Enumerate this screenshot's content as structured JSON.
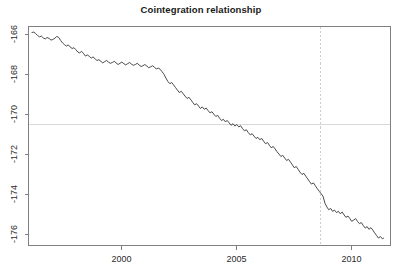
{
  "chart_data": {
    "type": "line",
    "title": "Cointegration relationship",
    "xlabel": "",
    "ylabel": "",
    "grid": false,
    "legend": null,
    "xlim": [
      1996.05,
      1996.05
    ],
    "xaxis": {
      "ticks": [
        2000,
        2005,
        2010
      ],
      "tick_labels": [
        "2000",
        "2005",
        "2010"
      ],
      "range": [
        1996.0,
        1411.4
      ]
    },
    "yaxis": {
      "ticks": [
        -166,
        -168,
        -170,
        -172,
        -174,
        -176
      ],
      "tick_labels": [
        "-166",
        "-168",
        "-170",
        "-172",
        "-174",
        "-176"
      ],
      "range": [
        -176.55,
        -165.6
      ]
    },
    "annotations": [
      {
        "name": "mean-reference-line",
        "type": "hline",
        "y": -170.5,
        "style": "solid",
        "color": "#d9d9d9"
      },
      {
        "name": "break-date-line",
        "type": "vline",
        "x": 2008.65,
        "style": "dashed",
        "color": "#cccccc"
      }
    ],
    "series": [
      {
        "name": "cointegration residual",
        "color": "#4a4a4a",
        "x": [
          1996.1,
          1996.18,
          1996.26,
          1996.35,
          1996.43,
          1996.51,
          1996.6,
          1996.68,
          1996.76,
          1996.85,
          1996.93,
          1997.01,
          1997.1,
          1997.18,
          1997.26,
          1997.35,
          1997.43,
          1997.51,
          1997.6,
          1997.68,
          1997.76,
          1997.85,
          1997.93,
          1998.01,
          1998.1,
          1998.18,
          1998.26,
          1998.35,
          1998.43,
          1998.51,
          1998.6,
          1998.68,
          1998.76,
          1998.85,
          1998.93,
          1999.01,
          1999.1,
          1999.18,
          1999.26,
          1999.35,
          1999.43,
          1999.51,
          1999.6,
          1999.68,
          1999.76,
          1999.85,
          1999.93,
          2000.01,
          2000.1,
          2000.18,
          2000.26,
          2000.35,
          2000.43,
          2000.51,
          2000.6,
          2000.68,
          2000.76,
          2000.85,
          2000.93,
          2001.01,
          2001.1,
          2001.18,
          2001.26,
          2001.35,
          2001.43,
          2001.51,
          2001.6,
          2001.68,
          2001.76,
          2001.85,
          2001.93,
          2002.01,
          2002.1,
          2002.18,
          2002.26,
          2002.35,
          2002.43,
          2002.51,
          2002.6,
          2002.68,
          2002.76,
          2002.85,
          2002.93,
          2003.01,
          2003.1,
          2003.18,
          2003.26,
          2003.35,
          2003.43,
          2003.51,
          2003.6,
          2003.68,
          2003.76,
          2003.85,
          2003.93,
          2004.01,
          2004.1,
          2004.18,
          2004.26,
          2004.35,
          2004.43,
          2004.51,
          2004.6,
          2004.68,
          2004.76,
          2004.85,
          2004.93,
          2005.01,
          2005.1,
          2005.18,
          2005.26,
          2005.35,
          2005.43,
          2005.51,
          2005.6,
          2005.68,
          2005.76,
          2005.85,
          2005.93,
          2006.01,
          2006.1,
          2006.18,
          2006.26,
          2006.35,
          2006.43,
          2006.51,
          2006.6,
          2006.68,
          2006.76,
          2006.85,
          2006.93,
          2007.01,
          2007.1,
          2007.18,
          2007.26,
          2007.35,
          2007.43,
          2007.51,
          2007.6,
          2007.68,
          2007.76,
          2007.85,
          2007.93,
          2008.01,
          2008.1,
          2008.18,
          2008.26,
          2008.35,
          2008.43,
          2008.51,
          2008.6,
          2008.68,
          2008.76,
          2008.85,
          2008.93,
          2009.01,
          2009.1,
          2009.18,
          2009.26,
          2009.35,
          2009.43,
          2009.51,
          2009.6,
          2009.68,
          2009.76,
          2009.85,
          2009.93,
          2010.01,
          2010.1,
          2010.18,
          2010.26,
          2010.35,
          2010.43,
          2010.51,
          2010.6,
          2010.68,
          2010.76,
          2010.85,
          2010.93,
          2011.01,
          2011.1,
          2011.18,
          2011.26,
          2011.35,
          2011.4
        ],
        "y": [
          -165.9,
          -165.88,
          -165.95,
          -166.05,
          -166.12,
          -166.08,
          -166.18,
          -166.22,
          -166.15,
          -166.2,
          -166.28,
          -166.25,
          -166.18,
          -166.1,
          -166.14,
          -166.3,
          -166.42,
          -166.5,
          -166.58,
          -166.52,
          -166.62,
          -166.7,
          -166.66,
          -166.76,
          -166.88,
          -166.92,
          -166.84,
          -166.96,
          -167.08,
          -167.02,
          -167.1,
          -167.18,
          -167.12,
          -167.22,
          -167.3,
          -167.26,
          -167.34,
          -167.42,
          -167.36,
          -167.3,
          -167.38,
          -167.44,
          -167.4,
          -167.34,
          -167.42,
          -167.5,
          -167.44,
          -167.38,
          -167.46,
          -167.52,
          -167.46,
          -167.4,
          -167.48,
          -167.54,
          -167.5,
          -167.44,
          -167.52,
          -167.6,
          -167.56,
          -167.5,
          -167.58,
          -167.66,
          -167.62,
          -167.56,
          -167.64,
          -167.72,
          -167.68,
          -167.74,
          -167.86,
          -168.0,
          -168.18,
          -168.34,
          -168.46,
          -168.4,
          -168.52,
          -168.66,
          -168.78,
          -168.9,
          -168.84,
          -168.96,
          -169.08,
          -169.2,
          -169.14,
          -169.26,
          -169.4,
          -169.52,
          -169.46,
          -169.58,
          -169.7,
          -169.62,
          -169.74,
          -169.68,
          -169.8,
          -169.92,
          -169.86,
          -169.98,
          -170.1,
          -170.04,
          -170.18,
          -170.3,
          -170.24,
          -170.36,
          -170.3,
          -170.42,
          -170.54,
          -170.46,
          -170.58,
          -170.5,
          -170.62,
          -170.56,
          -170.7,
          -170.82,
          -170.76,
          -170.9,
          -171.02,
          -170.96,
          -171.08,
          -171.2,
          -171.14,
          -171.26,
          -171.2,
          -171.34,
          -171.46,
          -171.4,
          -171.54,
          -171.66,
          -171.6,
          -171.72,
          -171.86,
          -171.98,
          -172.1,
          -172.04,
          -172.18,
          -172.3,
          -172.24,
          -172.38,
          -172.52,
          -172.66,
          -172.6,
          -172.74,
          -172.88,
          -173.0,
          -172.94,
          -173.08,
          -173.22,
          -173.36,
          -173.48,
          -173.42,
          -173.56,
          -173.7,
          -173.84,
          -173.96,
          -174.08,
          -174.44,
          -174.62,
          -174.76,
          -174.7,
          -174.84,
          -174.78,
          -174.9,
          -174.84,
          -174.96,
          -174.88,
          -175.02,
          -175.14,
          -175.08,
          -175.2,
          -175.34,
          -175.28,
          -175.2,
          -175.34,
          -175.46,
          -175.4,
          -175.54,
          -175.68,
          -175.6,
          -175.74,
          -175.66,
          -175.78,
          -175.92,
          -176.06,
          -176.18,
          -176.1,
          -176.22,
          -176.18
        ]
      }
    ]
  }
}
